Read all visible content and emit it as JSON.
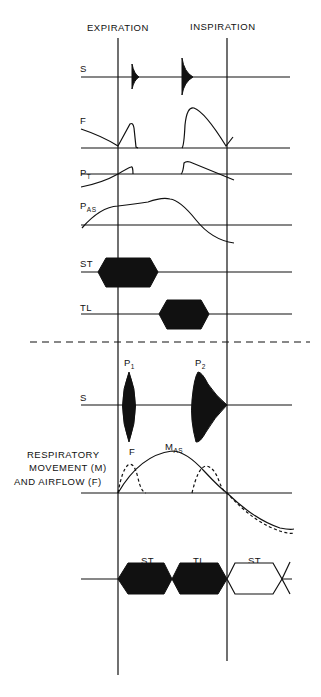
{
  "header": {
    "expiration": "EXPIRATION",
    "inspiration": "INSPIRATION"
  },
  "upper_panel": {
    "rows": [
      {
        "id": "S",
        "label": "S"
      },
      {
        "id": "F",
        "label": "F"
      },
      {
        "id": "PT",
        "label": "P",
        "subscript": "T"
      },
      {
        "id": "PAS",
        "label": "P",
        "subscript": "AS"
      },
      {
        "id": "ST",
        "label": "ST"
      },
      {
        "id": "TL",
        "label": "TL"
      }
    ]
  },
  "lower_panel": {
    "peaks": [
      {
        "label": "P",
        "subscript": "1"
      },
      {
        "label": "P",
        "subscript": "2"
      }
    ],
    "sound_label": "S",
    "movement_curve_label": "M",
    "movement_curve_subscript": "AS",
    "airflow_curve_label": "F",
    "respiratory_label_lines": [
      "RESPIRATORY",
      "MOVEMENT (M)",
      "AND AIRFLOW (F)"
    ],
    "phases": [
      "ST",
      "TL",
      "ST"
    ]
  },
  "colors": {
    "ink": "#111111",
    "background": "#ffffff"
  }
}
